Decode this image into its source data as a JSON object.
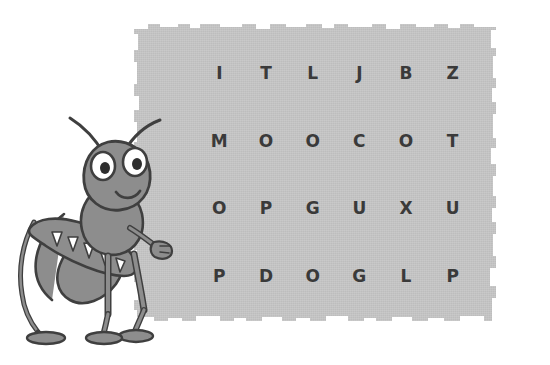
{
  "page": {
    "background_color": "#ffffff",
    "width": 550,
    "height": 365
  },
  "paper_panel": {
    "name": "letter-grid-panel",
    "fill_color": "#c5c5c5",
    "edge_style": "torn",
    "texture": "paper-grain"
  },
  "letter_grid": {
    "columns": 6,
    "rows": 4,
    "text_color": "#3a3a3a",
    "cells": [
      [
        "I",
        "T",
        "L",
        "J",
        "B",
        "Z"
      ],
      [
        "M",
        "O",
        "O",
        "C",
        "O",
        "T"
      ],
      [
        "O",
        "P",
        "G",
        "U",
        "X",
        "U"
      ],
      [
        "P",
        "D",
        "O",
        "G",
        "L",
        "P"
      ]
    ],
    "rows_as_strings": [
      "I T L J B Z",
      "M O O C O T",
      "O P G U X U",
      "P D O G L P"
    ]
  },
  "illustration": {
    "name": "grasshopper",
    "description": "cartoon grasshopper standing, facing right",
    "palette": {
      "body": "#8d8d8d",
      "body_shade": "#7a7a7a",
      "body_light": "#9b9b9b",
      "outline": "#3f3f3f",
      "eye_white": "#ffffff",
      "pupil": "#2e2e2e",
      "wing_spot": "#ffffff"
    },
    "parts": [
      "antenna-left",
      "antenna-right",
      "head",
      "eye-left",
      "eye-right",
      "mouth",
      "thorax",
      "abdomen",
      "wing",
      "foreleg",
      "midleg",
      "hindleg",
      "arm",
      "hand",
      "foot-front",
      "foot-middle",
      "foot-back"
    ]
  }
}
